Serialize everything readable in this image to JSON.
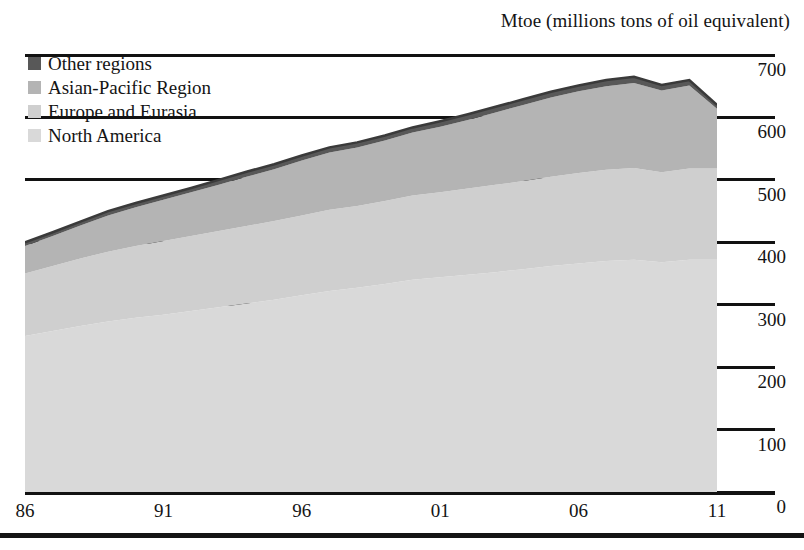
{
  "chart_data": {
    "type": "area",
    "stacked": true,
    "title": "Mtoe (millions tons of oil equivalent)",
    "xlabel": "",
    "ylabel": "Mtoe (millions tons of oil equivalent)",
    "ylim": [
      0,
      700
    ],
    "yticks": [
      0,
      100,
      200,
      300,
      400,
      500,
      600,
      700
    ],
    "xlim": [
      1986,
      2011
    ],
    "xticks": [
      1986,
      1991,
      1996,
      2001,
      2006,
      2011
    ],
    "xtick_labels": [
      "86",
      "91",
      "96",
      "01",
      "06",
      "11"
    ],
    "grid": true,
    "legend_position": "top-left",
    "x": [
      1986,
      1987,
      1988,
      1989,
      1990,
      1991,
      1992,
      1993,
      1994,
      1995,
      1996,
      1997,
      1998,
      1999,
      2000,
      2001,
      2002,
      2003,
      2004,
      2005,
      2006,
      2007,
      2008,
      2009,
      2010,
      2011
    ],
    "series": [
      {
        "name": "North America",
        "color": "#d9d9d9",
        "values": [
          250,
          258,
          266,
          273,
          279,
          284,
          290,
          296,
          302,
          308,
          315,
          322,
          327,
          333,
          340,
          344,
          348,
          352,
          357,
          362,
          366,
          370,
          372,
          368,
          372,
          372
        ]
      },
      {
        "name": "Europe and Eurasia",
        "color": "#cfcfcf",
        "values": [
          100,
          104,
          108,
          112,
          115,
          118,
          120,
          122,
          124,
          126,
          128,
          130,
          131,
          133,
          135,
          136,
          138,
          140,
          141,
          143,
          145,
          146,
          147,
          144,
          146,
          146
        ]
      },
      {
        "name": "Asian-Pacific Region",
        "color": "#b4b4b4",
        "values": [
          44,
          48,
          53,
          58,
          62,
          66,
          70,
          74,
          79,
          83,
          88,
          92,
          94,
          97,
          101,
          105,
          110,
          116,
          122,
          127,
          131,
          134,
          136,
          131,
          133,
          96
        ]
      },
      {
        "name": "Other regions",
        "color": "#585858",
        "values": [
          6,
          6,
          6,
          7,
          7,
          7,
          7,
          8,
          8,
          8,
          8,
          8,
          8,
          8,
          8,
          9,
          9,
          9,
          9,
          9,
          9,
          10,
          10,
          9,
          9,
          6
        ]
      }
    ],
    "totals": [
      400,
      416,
      433,
      450,
      463,
      475,
      487,
      500,
      513,
      525,
      539,
      552,
      560,
      571,
      584,
      594,
      605,
      617,
      629,
      641,
      651,
      660,
      665,
      652,
      660,
      620
    ]
  },
  "legend": {
    "items": [
      {
        "label": "Other regions",
        "color": "#585858"
      },
      {
        "label": "Asian-Pacific Region",
        "color": "#b4b4b4"
      },
      {
        "label": "Europe and Eurasia",
        "color": "#cfcfcf"
      },
      {
        "label": "North America",
        "color": "#d9d9d9"
      }
    ]
  },
  "axis": {
    "y_labels": [
      "700",
      "600",
      "500",
      "400",
      "300",
      "200",
      "100",
      "0"
    ],
    "x_labels": [
      "86",
      "91",
      "96",
      "01",
      "06",
      "11"
    ]
  }
}
